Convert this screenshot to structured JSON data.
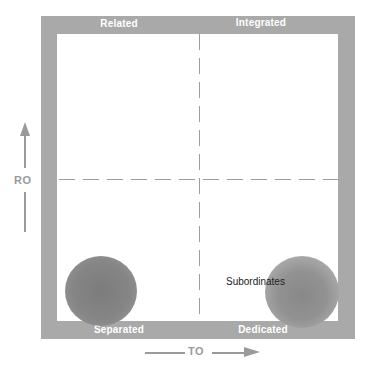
{
  "diagram": {
    "quadrant_labels": {
      "top_left": "Related",
      "top_right": "Integrated",
      "bottom_left": "Separated",
      "bottom_right": "Dedicated"
    },
    "axes": {
      "vertical": "RO",
      "horizontal": "TO"
    },
    "blobs": [
      {
        "position": "bottom-left",
        "label": ""
      },
      {
        "position": "bottom-right",
        "label": "Subordinates"
      }
    ],
    "colors": {
      "frame": "#a9a9a9",
      "arrows": "#9a9a9a",
      "blob": "#858585"
    }
  }
}
